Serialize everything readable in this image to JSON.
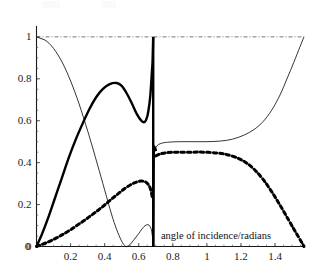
{
  "figure": {
    "background": "#ffffff",
    "width": 311,
    "height": 279
  },
  "axes": {
    "x_title": "angle of incidence/radians",
    "x_ticks": [
      "0",
      "0.2",
      "0.4",
      "0.6",
      "0.8",
      "1",
      "1.2",
      "1.4"
    ],
    "x_tick_values": [
      0,
      0.2,
      0.4,
      0.6,
      0.8,
      1,
      1.2,
      1.4
    ],
    "y_ticks": [
      "0",
      "0.2",
      "0.4",
      "0.6",
      "0.8",
      "1"
    ],
    "y_tick_values": [
      0,
      0.2,
      0.4,
      0.6,
      0.8,
      1
    ],
    "x_min": 0,
    "x_max": 1.57,
    "y_min": 0,
    "y_max": 1.04,
    "axis_color": "#1a1a1a"
  },
  "chart_data": {
    "type": "line",
    "title": "",
    "xlabel": "angle of incidence/radians",
    "ylabel": "",
    "xlim": [
      0,
      1.57
    ],
    "ylim": [
      0,
      1.04
    ],
    "grid": false,
    "legend": "none",
    "annotations": [
      {
        "text": "critical angle discontinuity",
        "x": 0.685,
        "type": "vertical-line"
      }
    ],
    "series": [
      {
        "name": "thin-solid-curve",
        "style": "solid",
        "width": 0.8,
        "color": "#000000",
        "x": [
          0.0,
          0.05,
          0.1,
          0.15,
          0.2,
          0.25,
          0.3,
          0.33,
          0.36,
          0.4,
          0.44,
          0.47,
          0.5,
          0.52,
          0.53,
          0.55,
          0.57,
          0.6,
          0.63,
          0.655,
          0.672,
          0.68,
          0.685
        ],
        "y": [
          1.0,
          0.985,
          0.945,
          0.88,
          0.79,
          0.68,
          0.552,
          0.47,
          0.385,
          0.27,
          0.155,
          0.082,
          0.025,
          0.003,
          0.0,
          0.01,
          0.03,
          0.062,
          0.094,
          0.104,
          0.086,
          0.05,
          0.0
        ]
      },
      {
        "name": "thin-solid-curve-upper-branch",
        "style": "solid",
        "width": 0.8,
        "color": "#000000",
        "x": [
          0.69,
          0.7,
          0.715,
          0.74,
          0.78,
          0.84,
          0.92,
          1.0,
          1.08,
          1.15,
          1.22,
          1.28,
          1.33,
          1.38,
          1.43,
          1.47,
          1.51,
          1.545,
          1.57
        ],
        "y": [
          0.455,
          0.472,
          0.486,
          0.494,
          0.498,
          0.5,
          0.5,
          0.5,
          0.503,
          0.512,
          0.532,
          0.56,
          0.596,
          0.65,
          0.724,
          0.8,
          0.878,
          0.95,
          1.0
        ]
      },
      {
        "name": "thick-solid-curve",
        "style": "solid",
        "width": 2.4,
        "color": "#000000",
        "x": [
          0.0,
          0.03,
          0.07,
          0.11,
          0.15,
          0.19,
          0.23,
          0.27,
          0.31,
          0.35,
          0.39,
          0.43,
          0.47,
          0.5,
          0.53,
          0.56,
          0.59,
          0.615,
          0.635,
          0.65,
          0.66,
          0.668,
          0.674,
          0.678,
          0.681,
          0.683,
          0.685
        ],
        "y": [
          0.0,
          0.055,
          0.14,
          0.235,
          0.33,
          0.425,
          0.51,
          0.585,
          0.655,
          0.712,
          0.752,
          0.775,
          0.78,
          0.766,
          0.73,
          0.682,
          0.63,
          0.6,
          0.594,
          0.62,
          0.665,
          0.72,
          0.79,
          0.842,
          0.88,
          0.94,
          1.0
        ]
      },
      {
        "name": "thick-solid-curve-right-stub",
        "style": "solid",
        "width": 2.4,
        "color": "#000000",
        "x": [
          0.685,
          0.688,
          0.694,
          0.702
        ],
        "y": [
          0.0,
          0.43,
          0.47,
          0.455
        ]
      },
      {
        "name": "thick-dashed-curve",
        "style": "dashed",
        "width": 3.0,
        "color": "#000000",
        "x": [
          0.0,
          0.04,
          0.08,
          0.12,
          0.16,
          0.2,
          0.24,
          0.28,
          0.32,
          0.36,
          0.4,
          0.44,
          0.48,
          0.52,
          0.56,
          0.59,
          0.615,
          0.635,
          0.65,
          0.662,
          0.67,
          0.676,
          0.68
        ],
        "y": [
          0.0,
          0.012,
          0.026,
          0.042,
          0.06,
          0.08,
          0.102,
          0.124,
          0.148,
          0.172,
          0.198,
          0.226,
          0.252,
          0.278,
          0.298,
          0.308,
          0.312,
          0.31,
          0.302,
          0.288,
          0.272,
          0.25,
          0.232
        ]
      },
      {
        "name": "thick-dashed-curve-right-branch",
        "style": "dashed",
        "width": 3.0,
        "color": "#000000",
        "x": [
          0.7,
          0.72,
          0.76,
          0.82,
          0.9,
          0.98,
          1.06,
          1.12,
          1.18,
          1.23,
          1.28,
          1.33,
          1.38,
          1.43,
          1.48,
          1.52,
          1.555,
          1.57
        ],
        "y": [
          0.432,
          0.44,
          0.447,
          0.45,
          0.45,
          0.45,
          0.446,
          0.438,
          0.422,
          0.4,
          0.366,
          0.32,
          0.262,
          0.196,
          0.126,
          0.07,
          0.022,
          0.0
        ]
      },
      {
        "name": "dash-dot-reference-line",
        "style": "dashdot",
        "width": 0.8,
        "color": "#555555",
        "x": [
          0.0,
          1.57
        ],
        "y": [
          1.0,
          1.0
        ]
      }
    ]
  }
}
